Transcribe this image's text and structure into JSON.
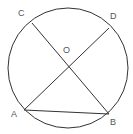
{
  "diagram": {
    "type": "circle-geometry",
    "stroke_color": "#333333",
    "label_color": "#555555",
    "circle": {
      "cx": 68,
      "cy": 68,
      "r": 60
    },
    "points": {
      "A": {
        "label": "A",
        "x": 24,
        "y": 110,
        "label_x": 11,
        "label_y": 117
      },
      "B": {
        "label": "B",
        "x": 109,
        "y": 114,
        "label_x": 110,
        "label_y": 125
      },
      "C": {
        "label": "C",
        "x": 32,
        "y": 23,
        "label_x": 18,
        "label_y": 16
      },
      "D": {
        "label": "D",
        "x": 109,
        "y": 28,
        "label_x": 110,
        "label_y": 19
      },
      "O": {
        "label": "O",
        "x": 68,
        "y": 67,
        "label_x": 63,
        "label_y": 53
      }
    },
    "segments": [
      {
        "name": "CB",
        "from": "C",
        "to": "B"
      },
      {
        "name": "AD",
        "from": "A",
        "to": "D"
      },
      {
        "name": "AB",
        "from": "A",
        "to": "B"
      }
    ]
  }
}
